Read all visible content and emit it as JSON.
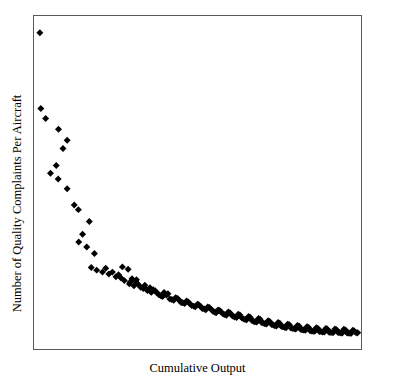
{
  "chart_data": {
    "type": "scatter",
    "title": "",
    "xlabel": "Cumulative Output",
    "ylabel": "Number of Quality Complaints Per Aircraft",
    "grid": false,
    "legend": false,
    "xticks": [],
    "yticks": [],
    "xlim": [
      0,
      100
    ],
    "ylim": [
      0,
      100
    ],
    "marker": "diamond",
    "marker_color": "#000000",
    "marker_size": 7,
    "points": [
      [
        0.9,
        95.8
      ],
      [
        1.2,
        72.6
      ],
      [
        2.7,
        69.6
      ],
      [
        6.7,
        66.3
      ],
      [
        9.4,
        62.9
      ],
      [
        8.1,
        60.4
      ],
      [
        6.0,
        55.2
      ],
      [
        4.2,
        52.8
      ],
      [
        6.6,
        51.1
      ],
      [
        9.4,
        48.1
      ],
      [
        11.6,
        43.1
      ],
      [
        12.9,
        41.7
      ],
      [
        16.3,
        38.1
      ],
      [
        14.2,
        34.2
      ],
      [
        13.0,
        31.8
      ],
      [
        15.5,
        30.3
      ],
      [
        17.9,
        28.3
      ],
      [
        16.9,
        24.0
      ],
      [
        18.6,
        23.2
      ],
      [
        20.4,
        22.6
      ],
      [
        22.4,
        22.0
      ],
      [
        24.6,
        21.2
      ],
      [
        26.1,
        20.9
      ],
      [
        28.4,
        23.5
      ],
      [
        29.0,
        19.5
      ],
      [
        30.2,
        18.4
      ],
      [
        31.5,
        18.9
      ],
      [
        33.1,
        17.6
      ],
      [
        34.4,
        17.0
      ],
      [
        35.6,
        16.4
      ],
      [
        36.8,
        16.9
      ],
      [
        38.0,
        15.7
      ],
      [
        39.1,
        15.1
      ],
      [
        40.3,
        15.6
      ],
      [
        41.4,
        14.4
      ],
      [
        42.6,
        14.0
      ],
      [
        43.8,
        14.5
      ],
      [
        44.9,
        13.3
      ],
      [
        46.0,
        13.0
      ],
      [
        47.1,
        13.5
      ],
      [
        48.2,
        12.4
      ],
      [
        49.3,
        12.0
      ],
      [
        50.4,
        12.6
      ],
      [
        51.5,
        11.5
      ],
      [
        52.6,
        11.1
      ],
      [
        53.7,
        11.8
      ],
      [
        54.8,
        10.6
      ],
      [
        55.8,
        10.2
      ],
      [
        56.9,
        10.9
      ],
      [
        58.0,
        9.8
      ],
      [
        59.0,
        9.4
      ],
      [
        60.1,
        10.2
      ],
      [
        61.1,
        9.1
      ],
      [
        62.2,
        8.7
      ],
      [
        63.2,
        9.5
      ],
      [
        64.3,
        8.3
      ],
      [
        65.3,
        8.0
      ],
      [
        66.4,
        8.8
      ],
      [
        67.4,
        7.6
      ],
      [
        68.4,
        7.3
      ],
      [
        69.5,
        8.2
      ],
      [
        70.5,
        7.0
      ],
      [
        71.5,
        6.7
      ],
      [
        72.5,
        7.5
      ],
      [
        73.6,
        6.4
      ],
      [
        74.6,
        6.1
      ],
      [
        75.6,
        7.0
      ],
      [
        76.6,
        5.9
      ],
      [
        77.6,
        5.6
      ],
      [
        78.6,
        6.5
      ],
      [
        79.6,
        5.4
      ],
      [
        80.6,
        5.2
      ],
      [
        81.6,
        6.1
      ],
      [
        82.6,
        5.0
      ],
      [
        83.6,
        4.8
      ],
      [
        84.6,
        5.7
      ],
      [
        85.6,
        4.6
      ],
      [
        86.5,
        4.5
      ],
      [
        87.5,
        5.4
      ],
      [
        88.5,
        4.4
      ],
      [
        89.5,
        4.3
      ],
      [
        90.4,
        5.2
      ],
      [
        91.4,
        4.2
      ],
      [
        92.3,
        4.1
      ],
      [
        93.3,
        5.0
      ],
      [
        94.2,
        4.1
      ],
      [
        95.1,
        4.0
      ],
      [
        96.1,
        4.9
      ],
      [
        97.0,
        4.0
      ],
      [
        97.9,
        3.9
      ],
      [
        98.8,
        4.6
      ],
      [
        99.7,
        4.0
      ],
      [
        27.2,
        20.0
      ],
      [
        28.8,
        19.0
      ],
      [
        30.7,
        19.8
      ],
      [
        32.3,
        18.0
      ],
      [
        34.0,
        17.4
      ],
      [
        35.2,
        17.8
      ],
      [
        37.4,
        16.2
      ],
      [
        38.6,
        15.4
      ],
      [
        40.8,
        16.0
      ],
      [
        42.0,
        14.2
      ],
      [
        43.2,
        14.8
      ],
      [
        45.4,
        13.2
      ],
      [
        46.6,
        13.8
      ],
      [
        48.8,
        12.2
      ],
      [
        50.0,
        12.8
      ],
      [
        52.1,
        11.3
      ],
      [
        53.2,
        11.9
      ],
      [
        55.3,
        10.4
      ],
      [
        56.4,
        11.0
      ],
      [
        58.5,
        9.6
      ],
      [
        59.6,
        10.4
      ],
      [
        61.6,
        8.9
      ],
      [
        62.7,
        9.7
      ],
      [
        64.8,
        8.1
      ],
      [
        65.9,
        9.0
      ],
      [
        67.9,
        7.4
      ],
      [
        69.0,
        8.4
      ],
      [
        71.0,
        6.8
      ],
      [
        72.0,
        7.7
      ],
      [
        74.1,
        6.2
      ],
      [
        75.1,
        7.2
      ],
      [
        77.1,
        5.7
      ],
      [
        78.1,
        6.7
      ],
      [
        80.1,
        5.3
      ],
      [
        81.1,
        6.3
      ],
      [
        83.1,
        4.9
      ],
      [
        84.1,
        5.9
      ],
      [
        86.0,
        4.5
      ],
      [
        87.0,
        5.6
      ],
      [
        89.0,
        4.3
      ],
      [
        90.0,
        5.4
      ],
      [
        91.9,
        4.1
      ],
      [
        92.8,
        5.2
      ],
      [
        94.7,
        4.0
      ],
      [
        95.6,
        5.1
      ],
      [
        97.5,
        3.9
      ],
      [
        98.4,
        4.8
      ],
      [
        99.2,
        4.2
      ],
      [
        21.4,
        23.8
      ],
      [
        23.5,
        22.6
      ],
      [
        25.4,
        21.8
      ],
      [
        26.6,
        24.2
      ],
      [
        29.6,
        20.6
      ],
      [
        31.0,
        20.3
      ],
      [
        33.6,
        18.6
      ],
      [
        36.2,
        17.2
      ],
      [
        39.6,
        16.4
      ],
      [
        44.4,
        13.9
      ],
      [
        47.6,
        12.9
      ],
      [
        51.0,
        12.1
      ],
      [
        54.3,
        11.2
      ],
      [
        57.4,
        10.3
      ],
      [
        60.6,
        9.5
      ],
      [
        63.8,
        8.6
      ],
      [
        66.9,
        7.9
      ],
      [
        70.0,
        7.2
      ],
      [
        73.1,
        6.6
      ],
      [
        76.1,
        6.0
      ],
      [
        79.1,
        5.5
      ],
      [
        82.1,
        5.1
      ],
      [
        85.1,
        4.7
      ],
      [
        88.0,
        4.4
      ],
      [
        91.0,
        4.2
      ],
      [
        93.8,
        4.1
      ],
      [
        96.6,
        4.0
      ],
      [
        99.9,
        4.1
      ]
    ]
  }
}
